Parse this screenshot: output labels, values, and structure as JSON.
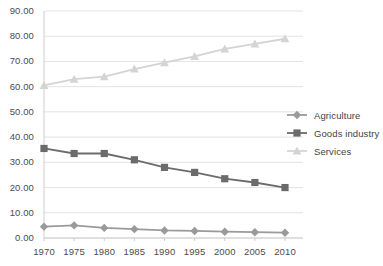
{
  "chart_data": {
    "type": "line",
    "title": "",
    "xlabel": "",
    "ylabel": "",
    "categories": [
      "1970",
      "1975",
      "1980",
      "1985",
      "1990",
      "1995",
      "2000",
      "2005",
      "2010"
    ],
    "series": [
      {
        "name": "Agriculture",
        "color": "#9a9a9a",
        "marker": "diamond",
        "values": [
          4.5,
          5.0,
          4.0,
          3.5,
          3.0,
          2.8,
          2.5,
          2.3,
          2.1
        ]
      },
      {
        "name": "Goods industry",
        "color": "#6b6b6b",
        "marker": "square",
        "values": [
          35.5,
          33.5,
          33.5,
          31.0,
          28.0,
          26.0,
          23.5,
          22.0,
          20.0
        ]
      },
      {
        "name": "Services",
        "color": "#d4d4d4",
        "marker": "triangle",
        "values": [
          60.5,
          63.0,
          64.0,
          67.0,
          69.5,
          72.0,
          75.0,
          77.0,
          79.0
        ]
      }
    ],
    "ylim": [
      0,
      90
    ],
    "ytick_step": 10,
    "ytick_labels": [
      "0.00",
      "10.00",
      "20.00",
      "30.00",
      "40.00",
      "50.00",
      "60.00",
      "70.00",
      "80.00",
      "90.00"
    ],
    "grid": true,
    "grid_color": "#e3e3e3",
    "axis_color": "#cdcdcd",
    "legend_position": "right",
    "background": "#ffffff"
  },
  "legend": {
    "items": [
      {
        "label": "Agriculture"
      },
      {
        "label": "Goods industry"
      },
      {
        "label": "Services"
      }
    ]
  }
}
